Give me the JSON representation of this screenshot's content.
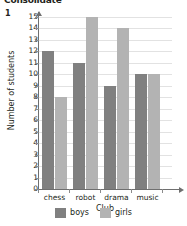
{
  "worksheet": {
    "title": "Consolidate",
    "question_number": "1"
  },
  "legend": {
    "items": [
      {
        "label": "boys",
        "color": "#808080"
      },
      {
        "label": "girls",
        "color": "#b3b3b3"
      }
    ]
  },
  "chart_data": {
    "type": "bar",
    "title": "",
    "xlabel": "Club",
    "ylabel": "Number of students",
    "categories": [
      "chess",
      "robot",
      "drama",
      "music"
    ],
    "series": [
      {
        "name": "boys",
        "color": "#808080",
        "values": [
          12,
          11,
          9,
          10
        ]
      },
      {
        "name": "girls",
        "color": "#b3b3b3",
        "values": [
          8,
          15,
          14,
          10
        ]
      }
    ],
    "ylim": [
      0,
      15
    ],
    "ytick_labels": [
      "15",
      "14",
      "13",
      "12",
      "11",
      "10",
      "9",
      "8",
      "7",
      "6",
      "5",
      "4",
      "3",
      "2",
      "1",
      "0"
    ],
    "ytick_values": [
      15,
      14,
      13,
      12,
      11,
      10,
      9,
      8,
      7,
      6,
      5,
      4,
      3,
      2,
      1,
      0
    ],
    "grid": true,
    "legend_position": "bottom"
  }
}
